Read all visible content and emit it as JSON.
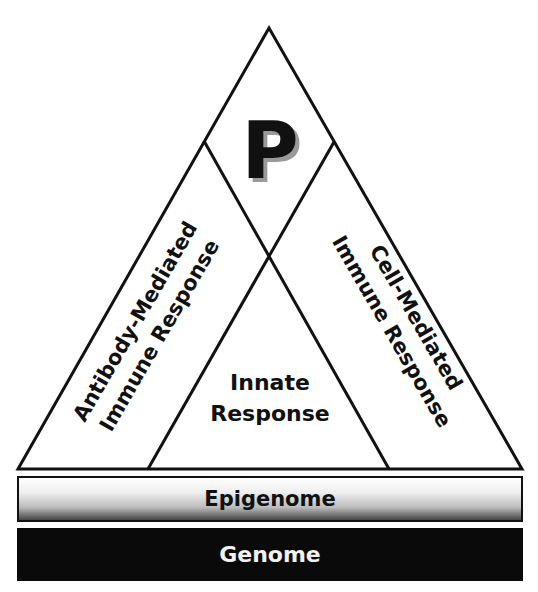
{
  "diagram": {
    "apex_letter": "P",
    "left_region": {
      "line1": "Antibody-Mediated",
      "line2": "Immune Response"
    },
    "right_region": {
      "line1": "Cell-Mediated",
      "line2": "Immune Response"
    },
    "center_region": {
      "line1": "Innate",
      "line2": "Response"
    },
    "layers": [
      {
        "label": "Epigenome",
        "fill": "gradient light-to-dark gray"
      },
      {
        "label": "Genome",
        "fill": "#0a0a0a"
      }
    ],
    "colors": {
      "line": "#111111",
      "background": "#ffffff",
      "genome_text": "#f2f2f2"
    }
  }
}
